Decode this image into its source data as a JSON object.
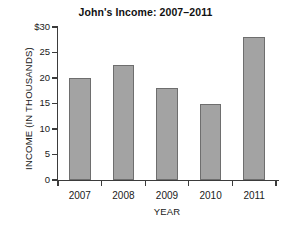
{
  "chart_data": {
    "type": "bar",
    "title": "John's Income: 2007–2011",
    "xlabel": "YEAR",
    "ylabel": "INCOME  (IN THOUSANDS)",
    "categories": [
      "2007",
      "2008",
      "2009",
      "2010",
      "2011"
    ],
    "values": [
      20,
      22.5,
      18,
      15,
      28
    ],
    "ylim": [
      0,
      30
    ],
    "ytick_values": [
      0,
      5,
      10,
      15,
      20,
      25,
      30
    ],
    "ytick_labels": [
      "0",
      "5",
      "10",
      "15",
      "20",
      "25",
      "$30"
    ],
    "grid": false,
    "legend": null,
    "bar_color": "#a3a3a3",
    "bar_edge_color": "#6e6e6e",
    "axis_color": "#3b3b3b",
    "background": "#ffffff"
  }
}
